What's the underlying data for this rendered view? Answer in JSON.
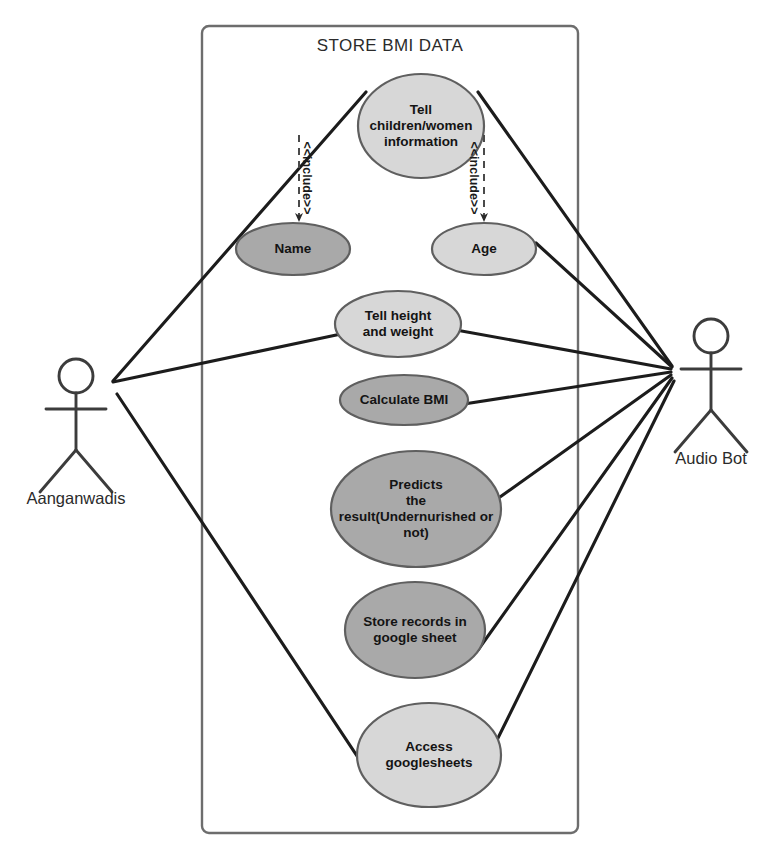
{
  "diagram": {
    "kind": "uml-use-case-diagram",
    "system_title": "STORE BMI DATA",
    "boundary": {
      "x": 202,
      "y": 26,
      "width": 376,
      "height": 807
    },
    "colors": {
      "background": "#ffffff",
      "stroke": "#3a3a3a",
      "line": "#1c1c1c",
      "ellipse_light": "#d7d7d7",
      "ellipse_dark": "#a9a9a9",
      "text": "#1a1a1a"
    }
  },
  "actors": [
    {
      "id": "aanganwadis",
      "label": "Aanganwadis",
      "side": "left",
      "head_cx": 76,
      "head_cy": 376,
      "head_r": 17,
      "body_top": 393,
      "body_bottom": 450,
      "arm_y": 409,
      "arm_left": 46,
      "arm_right": 106,
      "leg_left_x": 40,
      "leg_right_x": 112,
      "leg_y": 492,
      "label_x": 16,
      "label_y": 489,
      "label_w": 120
    },
    {
      "id": "audio-bot",
      "label": "Audio Bot",
      "side": "right",
      "head_cx": 711,
      "head_cy": 336,
      "head_r": 17,
      "body_top": 353,
      "body_bottom": 410,
      "arm_y": 369,
      "arm_left": 681,
      "arm_right": 741,
      "leg_left_x": 675,
      "leg_right_x": 747,
      "leg_y": 452,
      "label_x": 655,
      "label_y": 449,
      "label_w": 112
    }
  ],
  "use_cases": [
    {
      "id": "tell-info",
      "label": "Tell\nchildren/women\ninformation",
      "cx": 421,
      "cy": 126,
      "rx": 63,
      "ry": 52,
      "shade": "light"
    },
    {
      "id": "name",
      "label": "Name",
      "cx": 293,
      "cy": 249,
      "rx": 57,
      "ry": 26,
      "shade": "dark"
    },
    {
      "id": "age",
      "label": "Age",
      "cx": 484,
      "cy": 249,
      "rx": 52,
      "ry": 26,
      "shade": "light"
    },
    {
      "id": "tell-height-weight",
      "label": "Tell height\nand weight",
      "cx": 398,
      "cy": 324,
      "rx": 63,
      "ry": 33,
      "shade": "light"
    },
    {
      "id": "calculate-bmi",
      "label": "Calculate BMI",
      "cx": 404,
      "cy": 400,
      "rx": 64,
      "ry": 25,
      "shade": "dark"
    },
    {
      "id": "predicts-result",
      "label": "Predicts\nthe\nresult(Undernurished or\nnot)",
      "cx": 416,
      "cy": 509,
      "rx": 85,
      "ry": 58,
      "shade": "dark"
    },
    {
      "id": "store-records",
      "label": "Store records in\ngoogle sheet",
      "cx": 415,
      "cy": 630,
      "rx": 70,
      "ry": 48,
      "shade": "dark"
    },
    {
      "id": "access-googlesheets",
      "label": "Access\ngooglesheets",
      "cx": 429,
      "cy": 755,
      "rx": 72,
      "ry": 52,
      "shade": "light"
    }
  ],
  "includes": [
    {
      "id": "include-name",
      "label": "<<include>>",
      "from": "tell-info",
      "to": "name",
      "x1": 299,
      "y1": 135,
      "x2": 299,
      "y2": 221,
      "label_x": 307,
      "label_y": 178
    },
    {
      "id": "include-age",
      "label": "<<include>>",
      "from": "tell-info",
      "to": "age",
      "x1": 484,
      "y1": 135,
      "x2": 484,
      "y2": 221,
      "label_x": 474,
      "label_y": 178
    }
  ],
  "associations": [
    {
      "id": "assoc-aanganwadis-tell-info",
      "from": "aanganwadis",
      "to": "tell-info",
      "x1": 113,
      "y1": 381,
      "x2": 366,
      "y2": 92
    },
    {
      "id": "assoc-aanganwadis-tell-height-weight",
      "from": "aanganwadis",
      "to": "tell-height-weight",
      "x1": 113,
      "y1": 382,
      "x2": 341,
      "y2": 334
    },
    {
      "id": "assoc-aanganwadis-access-googlesheets",
      "from": "aanganwadis",
      "to": "access-googlesheets",
      "x1": 117,
      "y1": 394,
      "x2": 367,
      "y2": 771
    },
    {
      "id": "assoc-audiobot-tell-info",
      "from": "audio-bot",
      "to": "tell-info",
      "x1": 672,
      "y1": 366,
      "x2": 478,
      "y2": 92
    },
    {
      "id": "assoc-audiobot-age",
      "from": "audio-bot",
      "to": "age",
      "x1": 672,
      "y1": 367,
      "x2": 536,
      "y2": 243
    },
    {
      "id": "assoc-audiobot-tell-height-weight",
      "from": "audio-bot",
      "to": "tell-height-weight",
      "x1": 671,
      "y1": 369,
      "x2": 456,
      "y2": 330
    },
    {
      "id": "assoc-audiobot-calculate-bmi",
      "from": "audio-bot",
      "to": "calculate-bmi",
      "x1": 671,
      "y1": 372,
      "x2": 464,
      "y2": 404
    },
    {
      "id": "assoc-audiobot-predicts",
      "from": "audio-bot",
      "to": "predicts-result",
      "x1": 671,
      "y1": 375,
      "x2": 500,
      "y2": 497
    },
    {
      "id": "assoc-audiobot-store-records",
      "from": "audio-bot",
      "to": "store-records",
      "x1": 672,
      "y1": 378,
      "x2": 478,
      "y2": 650
    },
    {
      "id": "assoc-audiobot-access",
      "from": "audio-bot",
      "to": "access-googlesheets",
      "x1": 674,
      "y1": 381,
      "x2": 497,
      "y2": 740
    }
  ]
}
